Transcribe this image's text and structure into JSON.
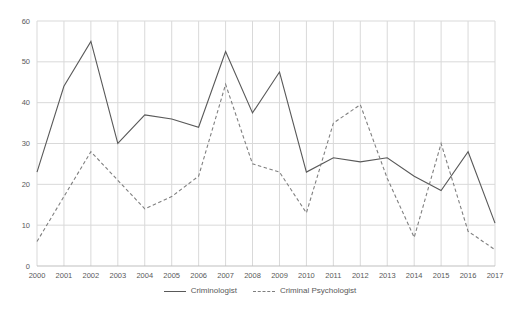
{
  "chart_data": {
    "type": "line",
    "title": "",
    "xlabel": "",
    "ylabel": "",
    "x": [
      "2000",
      "2001",
      "2002",
      "2003",
      "2004",
      "2005",
      "2006",
      "2007",
      "2008",
      "2009",
      "2010",
      "2011",
      "2012",
      "2013",
      "2014",
      "2015",
      "2016",
      "2017"
    ],
    "series": [
      {
        "name": "Criminologist",
        "style": "solid",
        "color": "#595959",
        "values": [
          23,
          44,
          55,
          30,
          37,
          36,
          34,
          52.5,
          37.5,
          47.5,
          23,
          26.5,
          25.5,
          26.5,
          22,
          18.5,
          28,
          10.5
        ]
      },
      {
        "name": "Criminal Psychologist",
        "style": "dashed",
        "color": "#7f7f7f",
        "values": [
          6,
          17,
          28,
          21,
          14,
          17,
          22,
          44.5,
          25,
          23,
          13,
          35,
          39.5,
          21.5,
          7,
          30,
          8.5,
          4
        ]
      }
    ],
    "ylim": [
      0,
      60
    ],
    "yticks": [
      0,
      10,
      20,
      30,
      40,
      50,
      60
    ],
    "grid": true,
    "legend_position": "bottom",
    "colors": {
      "gridline": "#d9d9d9",
      "axis": "#bfbfbf",
      "text": "#595959",
      "background": "#ffffff"
    }
  }
}
